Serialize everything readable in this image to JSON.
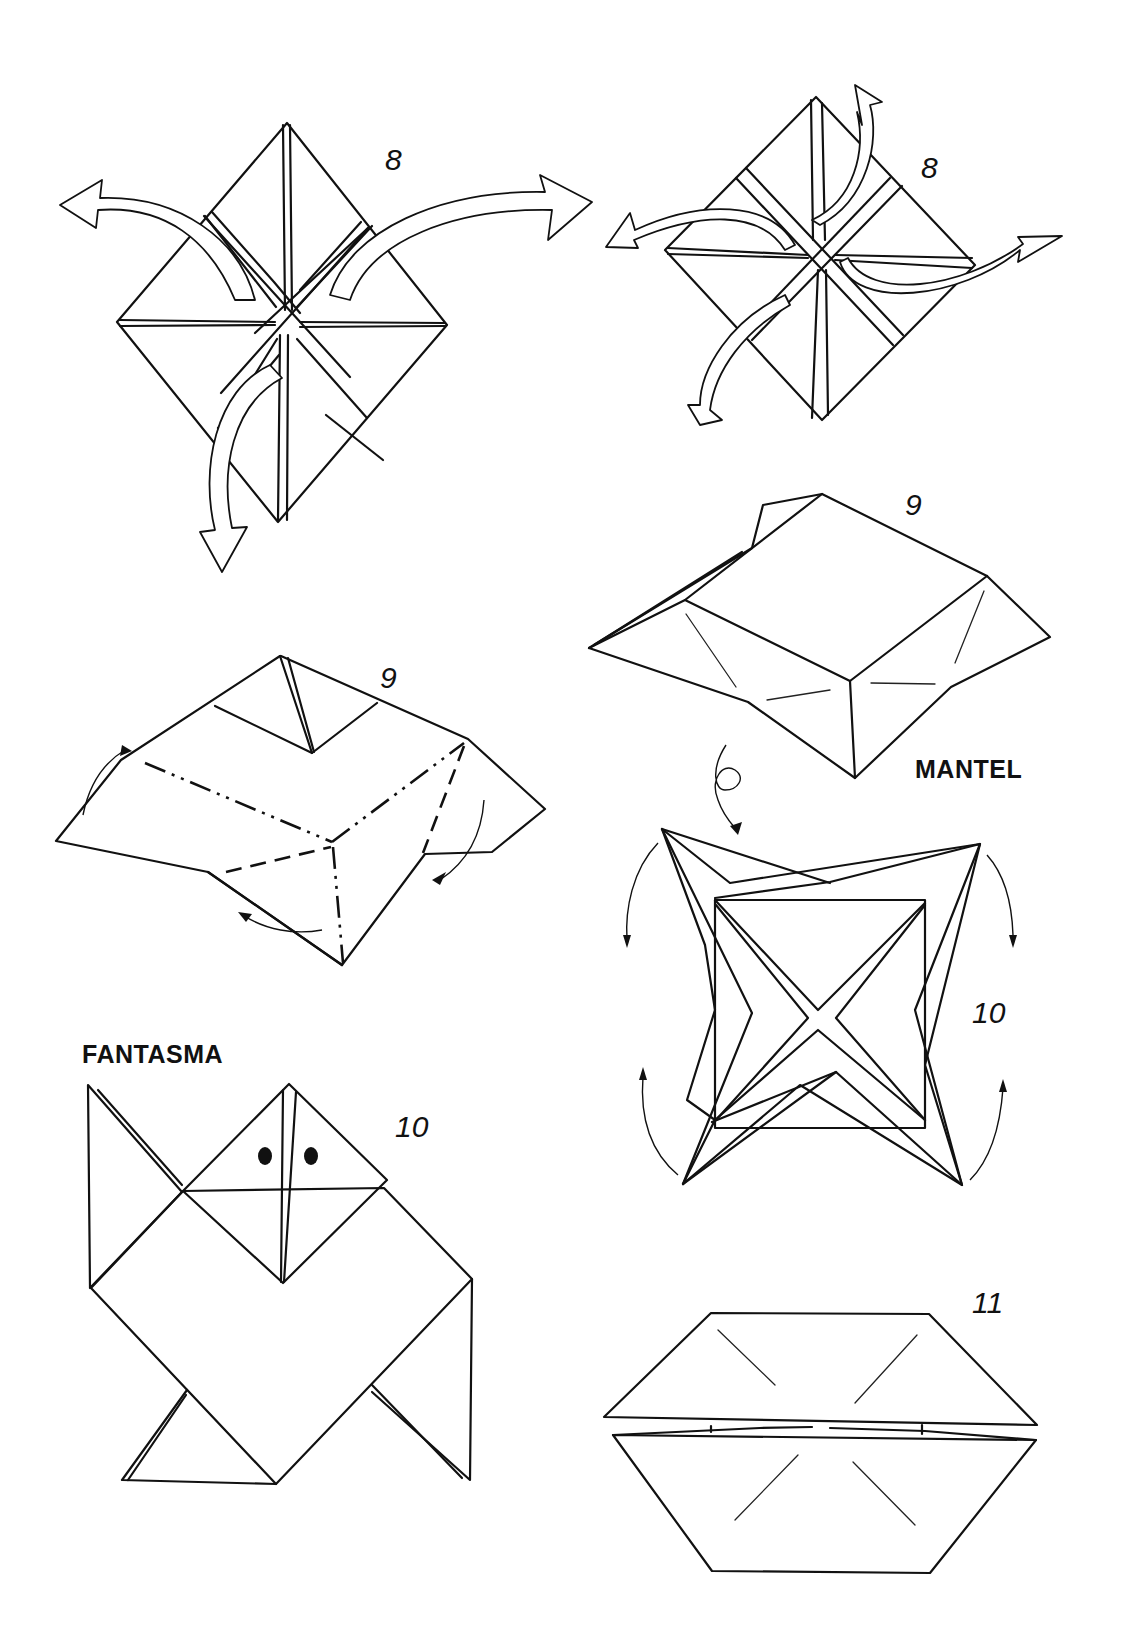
{
  "page": {
    "figures": [
      {
        "id": "fig-8-left",
        "step_label": "8"
      },
      {
        "id": "fig-8-right",
        "step_label": "8"
      },
      {
        "id": "fig-9-left",
        "step_label": "9"
      },
      {
        "id": "fig-9-mantel",
        "step_label": "9",
        "title": "MANTEL"
      },
      {
        "id": "fig-10-mantel",
        "step_label": "10"
      },
      {
        "id": "fig-10-fantasma",
        "step_label": "10",
        "title": "FANTASMA"
      },
      {
        "id": "fig-11",
        "step_label": "11"
      }
    ]
  },
  "icons": {
    "open_arrow": "hollow-curved-arrow-icon",
    "fold_arrow": "thin-curved-arrow-icon",
    "turn_over": "loop-arrow-icon"
  }
}
